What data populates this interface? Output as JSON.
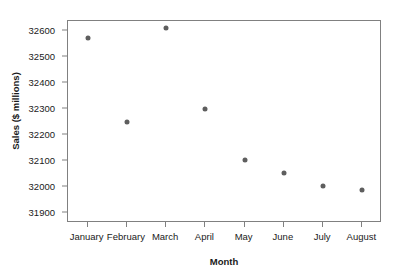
{
  "chart_data": {
    "type": "scatter",
    "title": "",
    "xlabel": "Month",
    "ylabel": "Sales ($ millions)",
    "categories": [
      "January",
      "February",
      "March",
      "April",
      "May",
      "June",
      "July",
      "August"
    ],
    "values": [
      32573,
      32249,
      32612,
      32299,
      32102,
      32055,
      32001,
      31988
    ],
    "ylim": [
      31860,
      32640
    ],
    "yticks": [
      31900,
      32000,
      32100,
      32200,
      32300,
      32400,
      32500,
      32600
    ],
    "ytick_labels": [
      "31900",
      "32000",
      "32100",
      "32200",
      "32300",
      "32400",
      "32500",
      "32600"
    ],
    "grid": false,
    "legend": false,
    "marker_color": "#5e5e5e",
    "frame_color": "#808080"
  }
}
